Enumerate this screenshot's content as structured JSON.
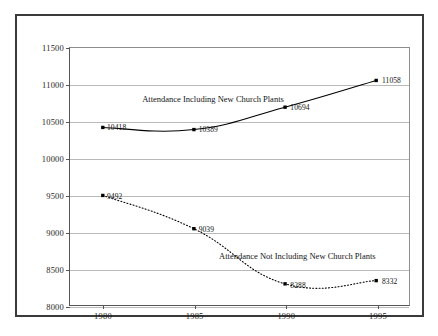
{
  "chart_data": {
    "type": "line",
    "title": "",
    "xlabel": "",
    "ylabel": "",
    "x": [
      1980,
      1985,
      1990,
      1995
    ],
    "categories": [
      "1980",
      "1985",
      "1990",
      "1995"
    ],
    "xlim": [
      1978.2,
      1996.8
    ],
    "ylim": [
      8000,
      11500
    ],
    "ytick_labels": [
      "8000",
      "8500",
      "9000",
      "9500",
      "10000",
      "10500",
      "11000",
      "11500"
    ],
    "ytick_values": [
      8000,
      8500,
      9000,
      9500,
      10000,
      10500,
      11000,
      11500
    ],
    "xtick_labels": [
      "1980",
      "1985",
      "1990",
      "1995"
    ],
    "grid": "horizontal",
    "legend_position": "inline-annotation",
    "series": [
      {
        "name": "Attendance Including New Church Plants",
        "annotation": "Attendance Including New Church Plants",
        "line_style": "solid",
        "color": "#000000",
        "values": [
          10418,
          10389,
          10694,
          11058
        ],
        "value_labels": [
          "10418",
          "10389",
          "10694",
          "11058"
        ]
      },
      {
        "name": "Attendance Not Including New Church Plants",
        "annotation": "Attendance Not Including New Church Plants",
        "line_style": "dotted",
        "color": "#000000",
        "values": [
          9492,
          9039,
          8288,
          8332
        ],
        "value_labels": [
          "9492",
          "9039",
          "8288",
          "8332"
        ]
      }
    ]
  }
}
